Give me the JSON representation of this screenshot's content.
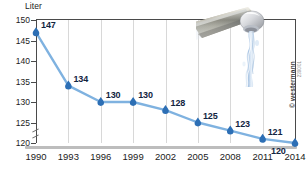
{
  "chart_data": {
    "type": "line",
    "title": "",
    "xlabel": "",
    "ylabel": "Liter",
    "categories": [
      "1990",
      "1993",
      "1996",
      "1999",
      "2002",
      "2005",
      "2008",
      "2011",
      "2014"
    ],
    "values": [
      147,
      134,
      130,
      130,
      128,
      125,
      123,
      121,
      120
    ],
    "point_labels": [
      "147",
      "134",
      "130",
      "130",
      "128",
      "125",
      "123",
      "121",
      "120"
    ],
    "ylim": [
      120,
      150
    ],
    "yticks": [
      120,
      125,
      130,
      135,
      140,
      145,
      150
    ],
    "ytick_labels": [
      "120",
      "125",
      "130",
      "135",
      "140",
      "145",
      "150"
    ],
    "xtick_labels": [
      "1990",
      "1993",
      "1996",
      "1999",
      "2002",
      "2005",
      "2008",
      "2011",
      "2014"
    ],
    "grid": "vertical",
    "axis_break": true,
    "legend": "none",
    "series_color": "#7fb2e0",
    "marker_color": "#2d6fb5",
    "label_color": "#12243f"
  },
  "axis": {
    "unit_label": "Liter"
  },
  "imagery": {
    "faucet_alt": "faucet-dripping-water"
  },
  "credits": {
    "copyright": "© westermann",
    "id_code": "2390/01"
  },
  "colors": {
    "line": "#7fb2e0",
    "marker": "#2d6fb5",
    "grid": "#d8d8d8",
    "frame": "#4a4a4a",
    "baseline": "#bdbdbd",
    "label_text": "#12243f",
    "axis_text": "#1b1b1b"
  }
}
